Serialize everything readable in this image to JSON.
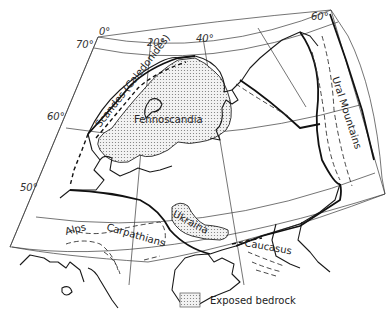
{
  "map": {
    "graticule": {
      "longitudes": [
        "0°",
        "20°",
        "40°",
        "60°"
      ],
      "latitudes": [
        "70°",
        "60°",
        "50°"
      ]
    },
    "labels": {
      "fennoscandia": "Fennoscandia",
      "caledonides": "Scandes (Caledonides)",
      "ural": "Ural Mountains",
      "ukraina": "Ukraina",
      "alps": "Alps",
      "carpathians": "Carpathians",
      "caucasus": "Caucasus"
    },
    "legend": {
      "bedrock_label": "Exposed bedrock"
    },
    "colors": {
      "line": "#1a1a1a",
      "stipple": "#888888",
      "background": "#ffffff"
    }
  }
}
